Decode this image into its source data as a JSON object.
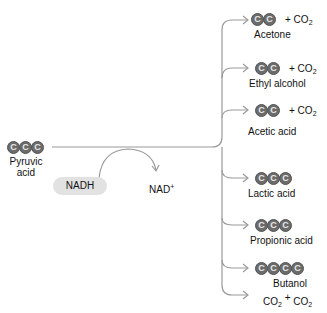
{
  "diagram": {
    "substrate": {
      "name": "Pyruvic acid",
      "line1": "Pyruvic",
      "line2": "acid",
      "carbons": 3
    },
    "cofactor_in": "NADH",
    "cofactor_out": "NAD",
    "cofactor_out_sup": "+",
    "atom_label": "C",
    "products": [
      {
        "name": "Acetone",
        "carbons": 2,
        "byproduct": "+ CO",
        "byproduct_sub": "2"
      },
      {
        "name": "Ethyl alcohol",
        "carbons": 2,
        "byproduct": "+ CO",
        "byproduct_sub": "2"
      },
      {
        "name": "Acetic acid",
        "carbons": 2,
        "byproduct": "+ CO",
        "byproduct_sub": "2"
      },
      {
        "name": "Lactic acid",
        "carbons": 3
      },
      {
        "name": "Propionic acid",
        "carbons": 3
      },
      {
        "name": "Butanol",
        "carbons": 4
      },
      {
        "name": "CO2 + CO2",
        "part1": "CO",
        "sub1": "2",
        "plus": "+",
        "part2": "CO",
        "sub2": "2"
      }
    ],
    "colors": {
      "atom_fill": "#6b6b6b",
      "line": "#9a9a9a",
      "nadh_bg": "#e2e2e2"
    }
  }
}
